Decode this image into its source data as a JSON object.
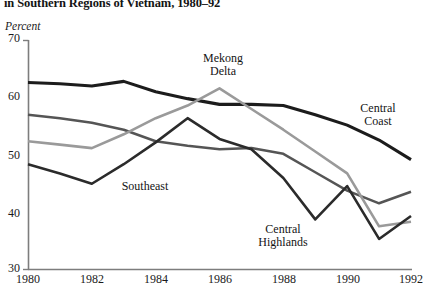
{
  "chart_data": {
    "type": "line",
    "title": "in Southern Regions of Vietnam, 1980–92",
    "ylabel": "Percent",
    "xlabel": "",
    "ylim": [
      30,
      70
    ],
    "xlim": [
      1980,
      1992
    ],
    "yticks": [
      30,
      40,
      50,
      60,
      70
    ],
    "xticks": [
      1980,
      1982,
      1984,
      1986,
      1988,
      1990,
      1992
    ],
    "grid": false,
    "legend_position": "inline-annotations",
    "x": [
      1980,
      1981,
      1982,
      1983,
      1984,
      1985,
      1986,
      1987,
      1988,
      1989,
      1990,
      1991,
      1992
    ],
    "series": [
      {
        "name": "Central Coast",
        "color": "#1c1c1c",
        "width": 3.1,
        "values": [
          62.6,
          62.4,
          62.0,
          62.8,
          61.0,
          59.8,
          58.8,
          58.8,
          58.6,
          57.0,
          55.2,
          52.6,
          49.2
        ]
      },
      {
        "name": "Southeast",
        "color": "#555555",
        "width": 2.5,
        "values": [
          57.0,
          56.4,
          55.6,
          54.4,
          52.4,
          51.6,
          51.0,
          51.2,
          50.2,
          47.0,
          43.8,
          41.6,
          43.6
        ]
      },
      {
        "name": "Mekong Delta",
        "color": "#9a9a9a",
        "width": 2.6,
        "values": [
          52.4,
          51.8,
          51.2,
          53.6,
          56.4,
          58.6,
          61.6,
          58.0,
          54.4,
          50.6,
          46.8,
          37.6,
          38.4
        ]
      },
      {
        "name": "Central Highlands",
        "color": "#2b2b2b",
        "width": 2.6,
        "values": [
          48.4,
          46.8,
          45.0,
          48.4,
          52.2,
          56.4,
          52.8,
          51.0,
          46.0,
          38.8,
          44.6,
          35.4,
          39.4
        ]
      }
    ],
    "annotations": [
      {
        "label": "Mekong Delta",
        "lines": [
          "Mekong",
          "Delta"
        ],
        "x": 223,
        "y": 52
      },
      {
        "label": "Central Coast",
        "lines": [
          "Central",
          "Coast"
        ],
        "x": 378,
        "y": 102
      },
      {
        "label": "Southeast",
        "lines": [
          "Southeast"
        ],
        "x": 145,
        "y": 180
      },
      {
        "label": "Central Highlands",
        "lines": [
          "Central",
          "Highlands"
        ],
        "x": 283,
        "y": 223
      }
    ]
  },
  "axis": {
    "y_tick_labels": [
      "70",
      "60",
      "50",
      "40",
      "30"
    ],
    "x_tick_labels": [
      "1980",
      "1982",
      "1984",
      "1986",
      "1988",
      "1990",
      "1992"
    ]
  },
  "colors": {
    "axis": "#7d7d7d",
    "text": "#1a1a1a",
    "background": "#ffffff"
  }
}
